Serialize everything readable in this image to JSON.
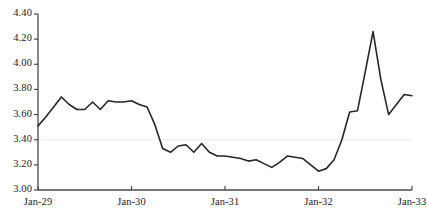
{
  "chart_data": {
    "type": "line",
    "title": "",
    "subtitle": "",
    "xlabel": "",
    "ylabel": "",
    "ylim": [
      3.0,
      4.4
    ],
    "ytick_labels": [
      "3.00",
      "3.20",
      "3.40",
      "3.60",
      "3.80",
      "4.00",
      "4.20",
      "4.40"
    ],
    "ytick_values": [
      3.0,
      3.2,
      3.4,
      3.6,
      3.8,
      4.0,
      4.2,
      4.4
    ],
    "xtick_labels": [
      "Jan-29",
      "Jan-30",
      "Jan-31",
      "Jan-32",
      "Jan-33"
    ],
    "xtick_values": [
      0,
      12,
      24,
      36,
      48
    ],
    "xlim": [
      0,
      48
    ],
    "grid": "single-faint-horizontal-gridline-at-3.40",
    "gridline_value": 3.4,
    "legend": "none",
    "legend_position": "none",
    "line_color": "#262626",
    "line_width": 1.6,
    "series": [
      {
        "name": "series-1",
        "x": [
          0,
          1,
          2,
          3,
          4,
          5,
          6,
          7,
          8,
          9,
          10,
          11,
          12,
          13,
          14,
          15,
          16,
          17,
          18,
          19,
          20,
          21,
          22,
          23,
          24,
          25,
          26,
          27,
          28,
          29,
          30,
          31,
          32,
          33,
          34,
          35,
          36,
          37,
          38,
          39,
          40,
          41,
          42,
          43,
          44,
          45,
          46,
          47,
          48
        ],
        "values": [
          3.51,
          3.58,
          3.66,
          3.74,
          3.68,
          3.64,
          3.64,
          3.7,
          3.64,
          3.71,
          3.7,
          3.7,
          3.71,
          3.68,
          3.66,
          3.52,
          3.33,
          3.3,
          3.35,
          3.36,
          3.3,
          3.37,
          3.3,
          3.27,
          3.27,
          3.26,
          3.25,
          3.23,
          3.24,
          3.21,
          3.18,
          3.22,
          3.27,
          3.26,
          3.25,
          3.2,
          3.15,
          3.17,
          3.24,
          3.4,
          3.62,
          3.63,
          3.94,
          4.26,
          3.88,
          3.6,
          3.68,
          3.76,
          3.75
        ]
      }
    ],
    "peak": {
      "x": 43,
      "value": 4.26
    },
    "trough": {
      "x": 36,
      "value": 3.15
    },
    "start": {
      "x": 0,
      "value": 3.51
    },
    "end": {
      "x": 48,
      "value": 3.24
    }
  },
  "axes": {
    "y_axis_name": "value-axis",
    "x_axis_name": "time-axis"
  }
}
